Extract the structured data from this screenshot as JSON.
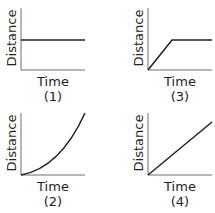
{
  "panels": [
    {
      "id": "1",
      "xlabel": "Time",
      "ylabel": "Distance",
      "number": "(1)",
      "shape": "horizontal-line"
    },
    {
      "id": "2",
      "xlabel": "Time",
      "ylabel": "Distance",
      "number": "(2)",
      "shape": "accelerating-curve"
    },
    {
      "id": "3",
      "xlabel": "Time",
      "ylabel": "Distance",
      "number": "(3)",
      "shape": "ramp-then-flat"
    },
    {
      "id": "4",
      "xlabel": "Time",
      "ylabel": "Distance",
      "number": "(4)",
      "shape": "straight-diagonal-line"
    }
  ],
  "colors": {
    "line": "#231f20",
    "axis": "#6d6e71",
    "text": "#231f20"
  }
}
